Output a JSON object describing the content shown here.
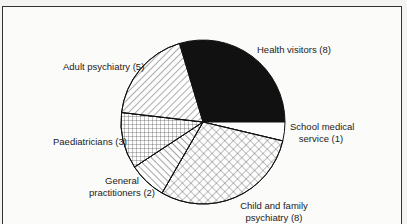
{
  "chart_data": {
    "type": "pie",
    "title": "",
    "total": 27,
    "start_angle_deg": -16.67,
    "direction": "clockwise",
    "slices": [
      {
        "label": "Health visitors",
        "value": 8,
        "display": "Health visitors (8)",
        "fill": "solid-black"
      },
      {
        "label": "School medical service",
        "value": 1,
        "display_lines": [
          "School medical",
          "service (1)"
        ],
        "fill": "white"
      },
      {
        "label": "Child and family psychiatry",
        "value": 8,
        "display_lines": [
          "Child and family",
          "psychiatry (8)"
        ],
        "fill": "diagonal-crosshatch"
      },
      {
        "label": "General practitioners",
        "value": 2,
        "display_lines": [
          "General",
          "practitioners (2)"
        ],
        "fill": "backslash-hatch"
      },
      {
        "label": "Paediatricians",
        "value": 3,
        "display": "Paediatricians (3)",
        "fill": "square-grid"
      },
      {
        "label": "Adult psychiatry",
        "value": 5,
        "display": "Adult psychiatry (5)",
        "fill": "forward-slash-hatch"
      }
    ],
    "legend": "none (labels placed beside slices)"
  },
  "labels": {
    "health_visitors": "Health visitors (8)",
    "school_medical_1": "School medical",
    "school_medical_2": "service (1)",
    "child_family_1": "Child and family",
    "child_family_2": "psychiatry (8)",
    "gp_1": "General",
    "gp_2": "practitioners (2)",
    "paediatricians": "Paediatricians (3)",
    "adult_psychiatry": "Adult psychiatry (5)"
  },
  "colors": {
    "ink": "#111111",
    "background": "#fbfbfa"
  }
}
